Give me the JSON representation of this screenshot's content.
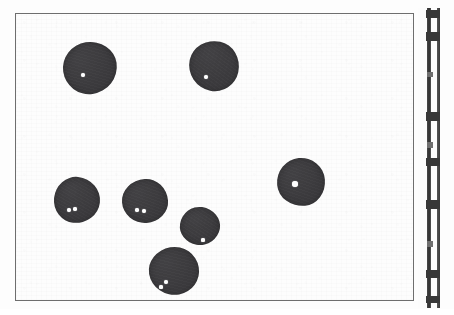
{
  "figure": {
    "kind": "scanned-specimen-plate",
    "caption": "",
    "background_color": "#fdfdfd",
    "frame_color": "#6e6e6e",
    "specimen_color": "#3c3b3e",
    "highlight_color": "#ffffff"
  },
  "frame": {
    "label": "photographic-field-border",
    "x": 15,
    "y": 13,
    "width": 399,
    "height": 288
  },
  "specimens": [
    {
      "id": "specimen-1",
      "label": "dark round specimen, upper left",
      "cx": 89,
      "cy": 67,
      "rx": 27,
      "ry": 26,
      "rotation": -8,
      "highlights": [
        {
          "cx": 82,
          "cy": 74,
          "r": 2.0
        }
      ]
    },
    {
      "id": "specimen-2",
      "label": "dark round specimen, upper middle",
      "cx": 213,
      "cy": 65,
      "rx": 25,
      "ry": 25,
      "rotation": 12,
      "highlights": [
        {
          "cx": 205,
          "cy": 76,
          "r": 2.4
        }
      ]
    },
    {
      "id": "specimen-3",
      "label": "dark round specimen, right middle",
      "cx": 300,
      "cy": 181,
      "rx": 24,
      "ry": 24,
      "rotation": -5,
      "highlights": [
        {
          "cx": 294,
          "cy": 183,
          "r": 2.8
        }
      ]
    },
    {
      "id": "specimen-4",
      "label": "dark round specimen, lower left",
      "cx": 76,
      "cy": 199,
      "rx": 23,
      "ry": 23,
      "rotation": 6,
      "highlights": [
        {
          "cx": 68,
          "cy": 209,
          "r": 1.9
        },
        {
          "cx": 74,
          "cy": 208,
          "r": 1.7
        }
      ]
    },
    {
      "id": "specimen-5",
      "label": "dark round specimen, lower middle-left",
      "cx": 144,
      "cy": 200,
      "rx": 23,
      "ry": 22,
      "rotation": -4,
      "highlights": [
        {
          "cx": 136,
          "cy": 209,
          "r": 1.7
        },
        {
          "cx": 143,
          "cy": 210,
          "r": 1.9
        }
      ]
    },
    {
      "id": "specimen-6",
      "label": "small dark round specimen, centre low",
      "cx": 199,
      "cy": 225,
      "rx": 20,
      "ry": 19,
      "rotation": 9,
      "highlights": [
        {
          "cx": 202,
          "cy": 239,
          "r": 1.6
        }
      ]
    },
    {
      "id": "specimen-7",
      "label": "dark round specimen, bottom",
      "cx": 173,
      "cy": 270,
      "rx": 25,
      "ry": 24,
      "rotation": -10,
      "highlights": [
        {
          "cx": 165,
          "cy": 281,
          "r": 2.0
        },
        {
          "cx": 160,
          "cy": 286,
          "r": 1.6
        }
      ]
    }
  ],
  "scale": {
    "label": "ruler-scale-strip",
    "orientation": "vertical",
    "x": 418,
    "y": 8,
    "width": 22,
    "height": 300,
    "ticks": [
      {
        "y": 2,
        "height": 8,
        "kind": "major"
      },
      {
        "y": 24,
        "height": 9,
        "kind": "major"
      },
      {
        "y": 64,
        "height": 5,
        "kind": "minor"
      },
      {
        "y": 104,
        "height": 9,
        "kind": "major"
      },
      {
        "y": 134,
        "height": 6,
        "kind": "minor"
      },
      {
        "y": 150,
        "height": 8,
        "kind": "major"
      },
      {
        "y": 192,
        "height": 9,
        "kind": "major"
      },
      {
        "y": 233,
        "height": 6,
        "kind": "minor"
      },
      {
        "y": 262,
        "height": 8,
        "kind": "major"
      },
      {
        "y": 288,
        "height": 7,
        "kind": "major"
      }
    ]
  }
}
